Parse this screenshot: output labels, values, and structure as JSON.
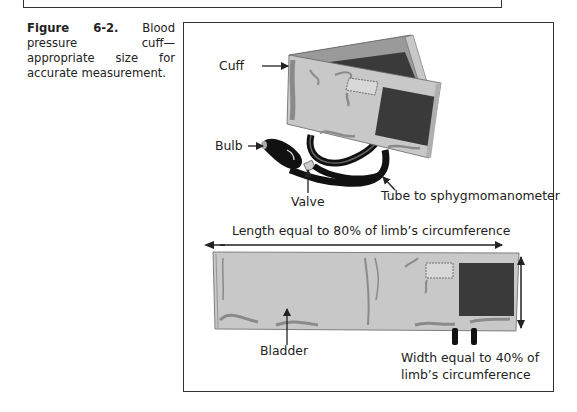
{
  "caption": {
    "figure_number": "Figure 6-2.",
    "text": "Blood pressure cuff—appropriate size for accurate measurement."
  },
  "labels": {
    "cuff": "Cuff",
    "bulb": "Bulb",
    "valve": "Valve",
    "tube": "Tube to sphygmomanometer",
    "length": "Length equal to 80% of limb’s circumference",
    "bladder": "Bladder",
    "width_line1": "Width equal to 40% of",
    "width_line2": "limb’s circumference"
  },
  "colors": {
    "cuff_fill": "#c8c8c8",
    "cuff_shadow": "#8a8a8a",
    "velcro": "#3a3a3a",
    "bulb": "#111111",
    "frame": "#333333"
  }
}
